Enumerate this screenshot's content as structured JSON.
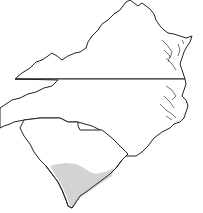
{
  "map": {
    "states": [
      {
        "id": "virginia",
        "label": "Virginia"
      },
      {
        "id": "north-carolina",
        "label": "North Carolina"
      },
      {
        "id": "south-carolina",
        "label": "South Carolina"
      }
    ],
    "highlight": {
      "region": "southern coastal South Carolina",
      "color": "#d3d3d3"
    },
    "outline_color": "#222222",
    "background": "#ffffff"
  }
}
